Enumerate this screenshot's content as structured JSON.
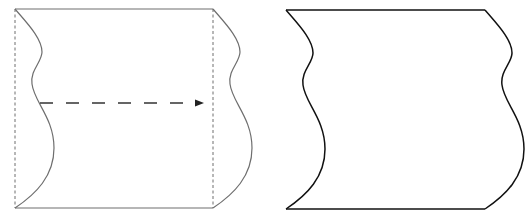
{
  "figure": {
    "panels": [
      {
        "name": "original-shape-with-translation",
        "elements": [
          "wavy-left-edge",
          "wavy-right-edge",
          "top-edge",
          "bottom-edge",
          "left-dashed-guide",
          "right-dashed-guide",
          "translation-arrow"
        ]
      },
      {
        "name": "resulting-shape",
        "elements": [
          "wavy-left-edge",
          "wavy-right-edge",
          "top-edge",
          "bottom-edge"
        ]
      }
    ],
    "colors": {
      "left_panel_stroke": "#6e6e6e",
      "arrow_stroke": "#333333",
      "right_panel_stroke": "#111111",
      "background": "#ffffff"
    }
  }
}
